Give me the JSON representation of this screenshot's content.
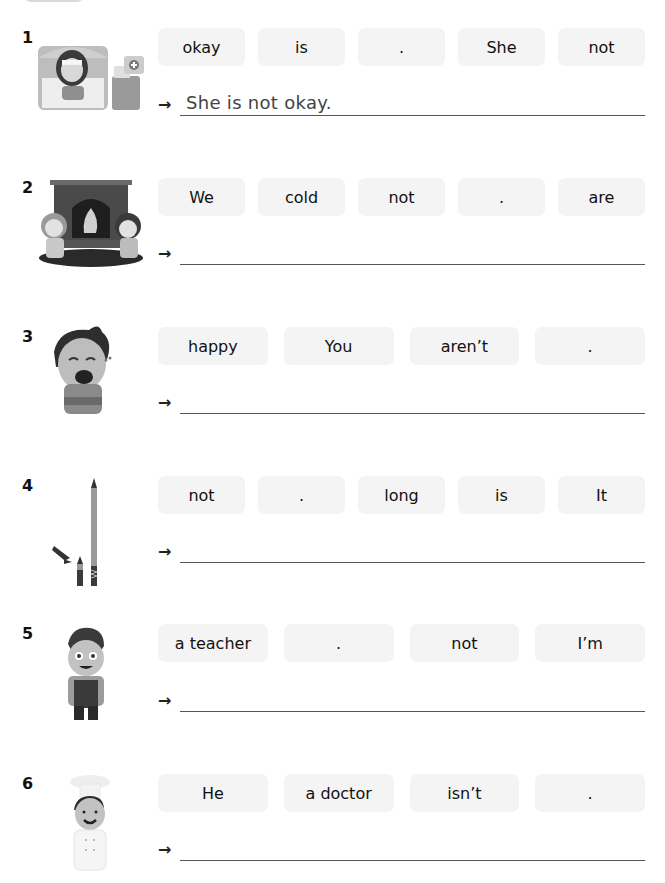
{
  "exercises": [
    {
      "number": "1",
      "image": "sick-girl-in-bed-illustration",
      "tokens": [
        "okay",
        "is",
        ".",
        "She",
        "not"
      ],
      "answer": "She is not okay.",
      "arrow": "→"
    },
    {
      "number": "2",
      "image": "kids-by-fireplace-illustration",
      "tokens": [
        "We",
        "cold",
        "not",
        ".",
        "are"
      ],
      "answer": "",
      "arrow": "→"
    },
    {
      "number": "3",
      "image": "crying-boy-illustration",
      "tokens": [
        "happy",
        "You",
        "aren’t",
        "."
      ],
      "answer": "",
      "arrow": "→"
    },
    {
      "number": "4",
      "image": "short-and-long-pencils-illustration",
      "tokens": [
        "not",
        ".",
        "long",
        "is",
        "It"
      ],
      "answer": "",
      "arrow": "→"
    },
    {
      "number": "5",
      "image": "smiling-boy-student-illustration",
      "tokens": [
        "a teacher",
        ".",
        "not",
        "I’m"
      ],
      "answer": "",
      "arrow": "→"
    },
    {
      "number": "6",
      "image": "chef-illustration",
      "tokens": [
        "He",
        "a doctor",
        "isn’t",
        "."
      ],
      "answer": "",
      "arrow": "→"
    }
  ]
}
